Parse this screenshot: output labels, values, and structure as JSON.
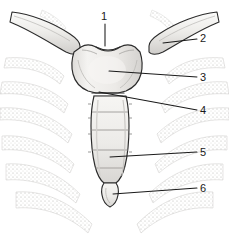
{
  "figure": {
    "style": "line-art medical illustration, grayscale stipple shading",
    "width": 229,
    "height": 243,
    "background_color": "#ffffff",
    "ink_color": "#1a1a1a",
    "bone_fill_color": "#f2f1ef",
    "bone_shadow_color": "#c9c7c4",
    "cartilage_stipple_color": "#a9a7a4"
  },
  "labels": [
    {
      "id": "label-1",
      "number": "1",
      "structure": "jugular notch (suprasternal notch)",
      "text_x": 101,
      "text_y": 11,
      "leader": {
        "x1": 105,
        "y1": 24,
        "x2": 105,
        "y2": 46
      }
    },
    {
      "id": "label-2",
      "number": "2",
      "structure": "clavicle",
      "text_x": 200,
      "text_y": 33,
      "leader": {
        "x1": 197,
        "y1": 39,
        "x2": 163,
        "y2": 43
      }
    },
    {
      "id": "label-3",
      "number": "3",
      "structure": "manubrium of sternum",
      "text_x": 200,
      "text_y": 72,
      "leader": {
        "x1": 197,
        "y1": 77,
        "x2": 109,
        "y2": 71
      }
    },
    {
      "id": "label-4",
      "number": "4",
      "structure": "sternal angle (manubriosternal joint)",
      "text_x": 200,
      "text_y": 105,
      "leader": {
        "x1": 197,
        "y1": 110,
        "x2": 99,
        "y2": 92
      }
    },
    {
      "id": "label-5",
      "number": "5",
      "structure": "body of sternum",
      "text_x": 200,
      "text_y": 147,
      "leader": {
        "x1": 197,
        "y1": 152,
        "x2": 110,
        "y2": 157
      }
    },
    {
      "id": "label-6",
      "number": "6",
      "structure": "xiphoid process",
      "text_x": 200,
      "text_y": 183,
      "leader": {
        "x1": 197,
        "y1": 188,
        "x2": 113,
        "y2": 194
      }
    }
  ],
  "structures": {
    "jugular_notch": "jugular notch",
    "left_clavicle": "left clavicle",
    "right_clavicle": "right clavicle",
    "manubrium": "manubrium",
    "sternal_angle": "sternal angle",
    "sternal_body": "body of sternum",
    "xiphoid_process": "xiphoid process",
    "left_costal_cartilages": "left costal cartilages",
    "right_costal_cartilages": "right costal cartilages"
  }
}
